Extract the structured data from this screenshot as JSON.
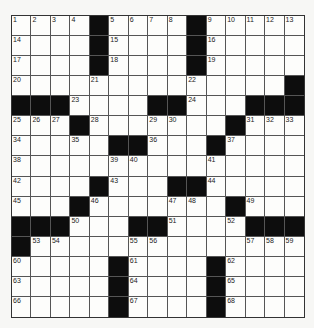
{
  "puzzle": {
    "rows": 15,
    "cols": 15,
    "grid": [
      [
        "1",
        "2",
        "3",
        "4",
        "#",
        "5",
        "6",
        "7",
        "8",
        "#",
        "9",
        "10",
        "11",
        "12",
        "13"
      ],
      [
        "14",
        ".",
        ".",
        ".",
        "#",
        "15",
        ".",
        ".",
        ".",
        "#",
        "16",
        ".",
        ".",
        ".",
        "."
      ],
      [
        "17",
        ".",
        ".",
        ".",
        "#",
        "18",
        ".",
        ".",
        ".",
        "#",
        "19",
        ".",
        ".",
        ".",
        "."
      ],
      [
        "20",
        ".",
        ".",
        ".",
        "21",
        ".",
        ".",
        ".",
        ".",
        "22",
        ".",
        ".",
        ".",
        ".",
        "#"
      ],
      [
        "#",
        "#",
        "#",
        "23",
        ".",
        ".",
        ".",
        "#",
        "#",
        "24",
        ".",
        ".",
        "#",
        "#",
        "#"
      ],
      [
        "25",
        "26",
        "27",
        "#",
        "28",
        ".",
        ".",
        "29",
        "30",
        ".",
        ".",
        "#",
        "31",
        "32",
        "33"
      ],
      [
        "34",
        ".",
        ".",
        "35",
        ".",
        "#",
        "#",
        "36",
        ".",
        ".",
        "#",
        "37",
        ".",
        ".",
        "."
      ],
      [
        "38",
        ".",
        ".",
        ".",
        ".",
        "39",
        "40",
        ".",
        ".",
        ".",
        "41",
        ".",
        ".",
        ".",
        "."
      ],
      [
        "42",
        ".",
        ".",
        ".",
        "#",
        "43",
        ".",
        ".",
        "#",
        "#",
        "44",
        ".",
        ".",
        ".",
        "."
      ],
      [
        "45",
        ".",
        ".",
        "#",
        "46",
        ".",
        ".",
        ".",
        "47",
        "48",
        ".",
        "#",
        "49",
        ".",
        "."
      ],
      [
        "#",
        "#",
        "#",
        "50",
        ".",
        ".",
        "#",
        "#",
        "51",
        ".",
        ".",
        "52",
        "#",
        "#",
        "#"
      ],
      [
        "#",
        "53",
        "54",
        ".",
        ".",
        ".",
        "55",
        "56",
        ".",
        ".",
        ".",
        ".",
        "57",
        "58",
        "59"
      ],
      [
        "60",
        ".",
        ".",
        ".",
        ".",
        "#",
        "61",
        ".",
        ".",
        ".",
        "#",
        "62",
        ".",
        ".",
        "."
      ],
      [
        "63",
        ".",
        ".",
        ".",
        ".",
        "#",
        "64",
        ".",
        ".",
        ".",
        "#",
        "65",
        ".",
        ".",
        "."
      ],
      [
        "66",
        ".",
        ".",
        ".",
        ".",
        "#",
        "67",
        ".",
        ".",
        ".",
        "#",
        "68",
        ".",
        ".",
        "."
      ]
    ],
    "colors": {
      "black_cell": "#0d0d0d",
      "white_cell": "#fdfdfb",
      "grid_line": "#555555"
    }
  }
}
